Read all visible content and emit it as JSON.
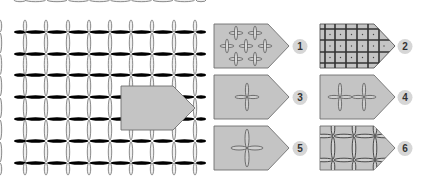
{
  "diagram": {
    "colors": {
      "background": "#ffffff",
      "swatch_fill": "#c4c4c4",
      "swatch_stroke": "#7a7a7a",
      "thread": "#6e6e6e",
      "thread_fill": "#ededed",
      "badge_fill": "#d6d6d6",
      "badge_text": "#333333"
    },
    "main_grid": {
      "rows": 7,
      "columns": 9
    },
    "variants": [
      {
        "number": "1",
        "pattern": "scattered-small-crosses"
      },
      {
        "number": "2",
        "pattern": "dense-plaid-grid"
      },
      {
        "number": "3",
        "pattern": "single-cross"
      },
      {
        "number": "4",
        "pattern": "double-cross"
      },
      {
        "number": "5",
        "pattern": "single-large-cross"
      },
      {
        "number": "6",
        "pattern": "wide-woven-grid"
      }
    ]
  }
}
